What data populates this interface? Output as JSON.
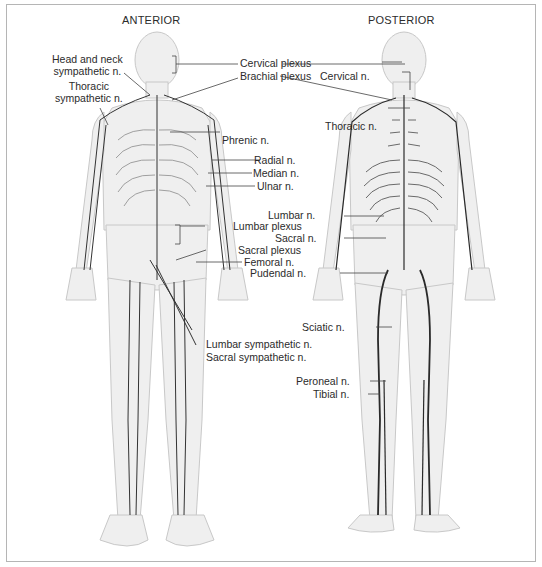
{
  "figure": {
    "views": [
      {
        "id": "anterior",
        "title": "ANTERIOR"
      },
      {
        "id": "posterior",
        "title": "POSTERIOR"
      }
    ],
    "anterior_labels": {
      "head_neck_sympathetic_1": "Head and neck",
      "head_neck_sympathetic_2": "sympathetic n.",
      "thoracic_sympathetic_1": "Thoracic",
      "thoracic_sympathetic_2": "sympathetic n.",
      "cervical_plexus": "Cervical plexus",
      "brachial_plexus": "Brachial plexus",
      "phrenic": "Phrenic n.",
      "radial": "Radial n.",
      "median": "Median n.",
      "ulnar": "Ulnar n.",
      "lumbar_plexus": "Lumbar plexus",
      "sacral_plexus": "Sacral plexus",
      "femoral": "Femoral n.",
      "lumbar_sympathetic": "Lumbar sympathetic n.",
      "sacral_sympathetic": "Sacral sympathetic n."
    },
    "posterior_labels": {
      "cervical": "Cervical n.",
      "thoracic": "Thoracic n.",
      "lumbar": "Lumbar n.",
      "sacral": "Sacral n.",
      "pudendal": "Pudendal n.",
      "sciatic": "Sciatic n.",
      "peroneal": "Peroneal n.",
      "tibial": "Tibial n."
    },
    "colors": {
      "body_fill": "#efefef",
      "body_outline": "#c8c8c8",
      "nerve": "#333333",
      "leader": "#444444",
      "frame": "#b5b5b5"
    }
  }
}
